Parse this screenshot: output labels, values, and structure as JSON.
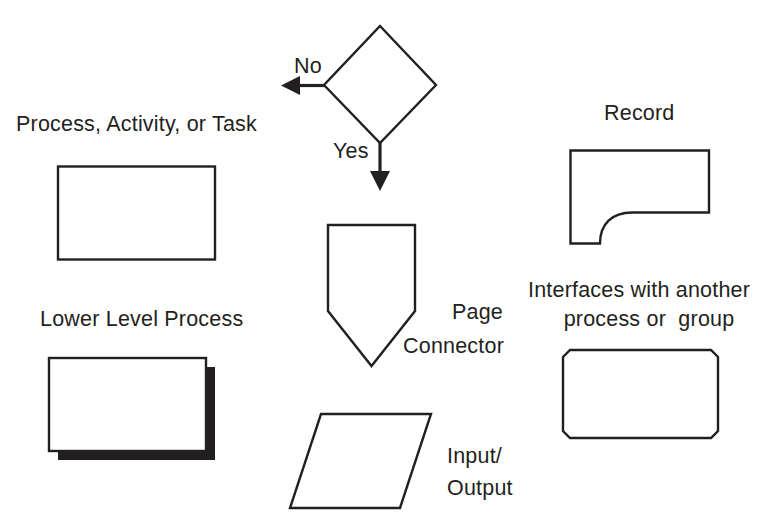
{
  "diagram": {
    "background_color": "#ffffff",
    "ink_color": "#231f20",
    "symbols": [
      {
        "id": "process",
        "label": "Process, Activity, or Task",
        "shape": "rectangle"
      },
      {
        "id": "lower-level-process",
        "label": "Lower Level Process",
        "shape": "stacked-rectangle-with-shadow"
      },
      {
        "id": "decision",
        "label": "",
        "shape": "diamond",
        "branch_labels": {
          "no": "No",
          "yes": "Yes"
        }
      },
      {
        "id": "page-connector",
        "label_line1": "Page",
        "label_line2": "Connector",
        "shape": "pentagon-down"
      },
      {
        "id": "input-output",
        "label_line1": "Input/",
        "label_line2": "Output",
        "shape": "parallelogram"
      },
      {
        "id": "record",
        "label": "Record",
        "shape": "record-notched"
      },
      {
        "id": "interface",
        "label_line1": "Interfaces with another",
        "label_line2": "process or  group",
        "shape": "chamfered-rectangle"
      }
    ]
  },
  "labels": {
    "process": "Process, Activity, or Task",
    "lower_level_process": "Lower Level Process",
    "decision_no": "No",
    "decision_yes": "Yes",
    "page_connector_line1": "Page",
    "page_connector_line2": "Connector",
    "input_output_line1": "Input/",
    "input_output_line2": "Output",
    "record": "Record",
    "interface_line1": "Interfaces with another",
    "interface_line2": "process or  group"
  }
}
